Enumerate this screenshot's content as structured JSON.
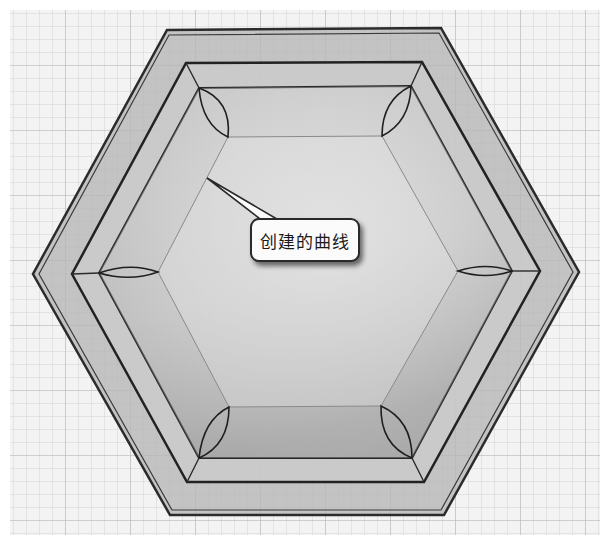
{
  "figure": {
    "background": "#f2f2f2",
    "grid": {
      "minor_spacing": 13,
      "minor_color": "#d6d6d6",
      "major_every": 5,
      "major_color": "#bdbdbd"
    },
    "colors": {
      "wall": "#b9b9b9",
      "rim": "#c8c8c8",
      "floor": "#d9d9d9",
      "edge": "#2b2b2b",
      "faint_edge": "#8a8a8a"
    }
  },
  "callout": {
    "label": "创建的曲线",
    "pointer_target": [
      207,
      178
    ]
  },
  "hexagons": {
    "outer": [
      [
        167,
        30
      ],
      [
        441,
        28
      ],
      [
        579,
        272
      ],
      [
        444,
        515
      ],
      [
        170,
        515
      ],
      [
        33,
        274
      ]
    ],
    "middle": [
      [
        186,
        63
      ],
      [
        422,
        62
      ],
      [
        540,
        271
      ],
      [
        424,
        482
      ],
      [
        187,
        482
      ],
      [
        72,
        274
      ]
    ],
    "inner_rim": [
      [
        199,
        88
      ],
      [
        411,
        86
      ],
      [
        512,
        271
      ],
      [
        412,
        458
      ],
      [
        199,
        458
      ],
      [
        99,
        273
      ]
    ],
    "floor": [
      [
        228,
        137
      ],
      [
        382,
        136
      ],
      [
        458,
        271
      ],
      [
        381,
        406
      ],
      [
        229,
        407
      ],
      [
        158,
        272
      ]
    ]
  }
}
